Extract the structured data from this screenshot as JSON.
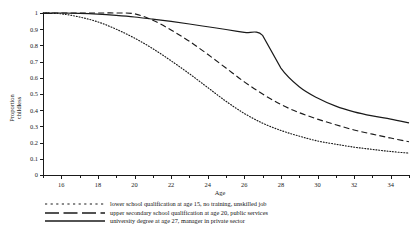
{
  "chart_data": {
    "type": "line",
    "title": "",
    "xlabel": "Age",
    "ylabel": "Proportion childless",
    "xlim": [
      15,
      35
    ],
    "ylim": [
      0,
      1
    ],
    "grid": false,
    "legend_position": "below-plot-left",
    "x_ticks_major": [
      16,
      18,
      20,
      22,
      24,
      26,
      28,
      30,
      32,
      34
    ],
    "x_ticks_minor": [
      15,
      17,
      19,
      21,
      23,
      25,
      27,
      29,
      31,
      33,
      35
    ],
    "y_ticks": [
      "0",
      "0.1",
      "0.2",
      "0.3",
      "0.4",
      "0.5",
      "0.6",
      "0.7",
      "0.8",
      "0.9",
      "1"
    ],
    "x": [
      15,
      16,
      17,
      18,
      19,
      20,
      21,
      22,
      23,
      24,
      25,
      26,
      27,
      28,
      29,
      30,
      31,
      32,
      33,
      34,
      35
    ],
    "series": [
      {
        "name": "lower school qualification at age 15, no training, unskilled job",
        "style": "dotted",
        "values": [
          1.0,
          0.995,
          0.975,
          0.945,
          0.9,
          0.845,
          0.78,
          0.705,
          0.625,
          0.54,
          0.455,
          0.38,
          0.32,
          0.275,
          0.24,
          0.21,
          0.19,
          0.172,
          0.158,
          0.145,
          0.135
        ]
      },
      {
        "name": "upper secondary school qualification at age 20, public services",
        "style": "dashed",
        "values": [
          1.0,
          1.0,
          1.0,
          1.0,
          1.0,
          0.995,
          0.955,
          0.895,
          0.825,
          0.745,
          0.66,
          0.575,
          0.5,
          0.435,
          0.385,
          0.345,
          0.31,
          0.278,
          0.252,
          0.228,
          0.205
        ]
      },
      {
        "name": "university degree at age 27, manager in private sector",
        "style": "solid",
        "values": [
          1.0,
          1.0,
          0.998,
          0.993,
          0.985,
          0.975,
          0.962,
          0.948,
          0.932,
          0.915,
          0.898,
          0.88,
          0.862,
          0.66,
          0.545,
          0.475,
          0.425,
          0.39,
          0.365,
          0.345,
          0.322
        ]
      }
    ]
  },
  "legend": {
    "entries": [
      {
        "label": "lower school qualification at age 15, no training, unskilled job",
        "style": "dotted"
      },
      {
        "label": "upper secondary school qualification at age 20, public services",
        "style": "dashed"
      },
      {
        "label": "university degree at age 27, manager in private sector",
        "style": "solid"
      }
    ]
  },
  "axes": {
    "x_title": "Age",
    "y_title_line1": "Proportion",
    "y_title_line2": "childless"
  }
}
